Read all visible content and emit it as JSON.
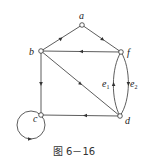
{
  "figure": {
    "caption": "图 6－16",
    "nodes": [
      {
        "id": "a",
        "label": "a",
        "x": 82,
        "y": 25
      },
      {
        "id": "b",
        "label": "b",
        "x": 41,
        "y": 51
      },
      {
        "id": "f",
        "label": "f",
        "x": 121,
        "y": 52
      },
      {
        "id": "c",
        "label": "c",
        "x": 41,
        "y": 115
      },
      {
        "id": "d",
        "label": "d",
        "x": 120,
        "y": 116
      }
    ],
    "edges": [
      {
        "from": "b",
        "to": "a",
        "label": ""
      },
      {
        "from": "a",
        "to": "f",
        "label": ""
      },
      {
        "from": "f",
        "to": "b",
        "label": ""
      },
      {
        "from": "b",
        "to": "c",
        "label": ""
      },
      {
        "from": "b",
        "to": "d",
        "label": ""
      },
      {
        "from": "d",
        "to": "c",
        "label": ""
      },
      {
        "from": "c",
        "to": "c",
        "label": "",
        "type": "self-loop"
      },
      {
        "from": "d",
        "to": "f",
        "label": "e1",
        "type": "curved-left"
      },
      {
        "from": "f",
        "to": "d",
        "label": "e2",
        "type": "curved-right"
      }
    ],
    "edge_labels": {
      "e1": "e",
      "e1_sub": "1",
      "e2": "e",
      "e2_sub": "2"
    },
    "colors": {
      "line": "#333333",
      "node_fill": "#ffffff"
    }
  }
}
